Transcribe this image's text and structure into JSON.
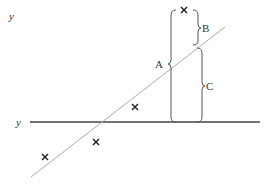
{
  "diagram": {
    "axis_label_top": "y",
    "mean_line_label": "y",
    "labels": {
      "total_deviation": "A",
      "unexplained_deviation": "B",
      "explained_deviation": "C"
    },
    "points": [
      {
        "id": "p1",
        "marker": "cross"
      },
      {
        "id": "p2",
        "marker": "cross"
      },
      {
        "id": "p3",
        "marker": "cross"
      },
      {
        "id": "p4",
        "marker": "cross"
      }
    ],
    "colors": {
      "mean_line": "#444444",
      "regression_line": "#aaaaaa",
      "braces": "#555555",
      "markers": "#222222"
    }
  }
}
